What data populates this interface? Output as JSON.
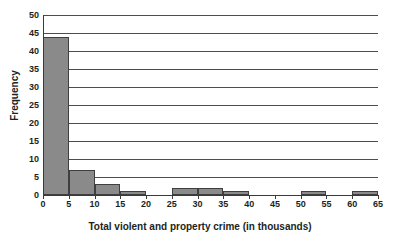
{
  "chart_data": {
    "type": "bar",
    "title": "",
    "xlabel": "Total violent and property crime (in thousands)",
    "ylabel": "Frequency",
    "xlim": [
      0,
      65
    ],
    "ylim": [
      0,
      50
    ],
    "grid": true,
    "legend": null,
    "bin_width": 5,
    "xticks": [
      0,
      5,
      10,
      15,
      20,
      25,
      30,
      35,
      40,
      45,
      50,
      55,
      60,
      65
    ],
    "yticks": [
      0,
      5,
      10,
      15,
      20,
      25,
      30,
      35,
      40,
      45,
      50
    ],
    "bin_edges": [
      0,
      5,
      10,
      15,
      20,
      25,
      30,
      35,
      40,
      45,
      50,
      55,
      60,
      65
    ],
    "categories": [
      "0-5",
      "5-10",
      "10-15",
      "15-20",
      "20-25",
      "25-30",
      "30-35",
      "35-40",
      "40-45",
      "45-50",
      "50-55",
      "55-60",
      "60-65"
    ],
    "values": [
      44,
      7,
      3,
      1,
      0,
      2,
      2,
      1,
      0,
      0,
      1,
      0,
      1
    ],
    "bar_color": "#8a8a8a",
    "bar_edge_color": "#3f3f3f",
    "gridline_color": "#4d4d4d",
    "axis_color": "#3a3a3a",
    "text_color": "#231f20",
    "background": "#ffffff"
  }
}
